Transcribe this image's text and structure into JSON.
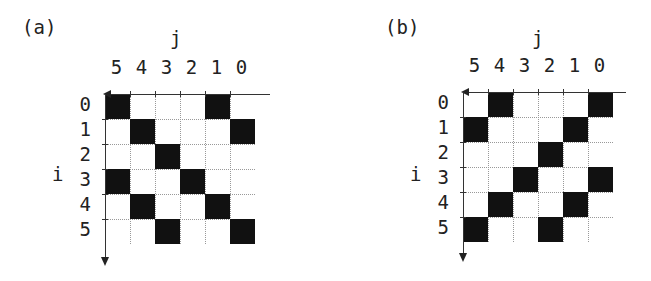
{
  "panels": [
    {
      "id": "a",
      "label": "(a)",
      "col_axis_title": "j",
      "row_axis_title": "i",
      "col_labels": [
        "5",
        "4",
        "3",
        "2",
        "1",
        "0"
      ],
      "row_labels": [
        "0",
        "1",
        "2",
        "3",
        "4",
        "5"
      ],
      "filled": [
        [
          1,
          0,
          0,
          0,
          1,
          0
        ],
        [
          0,
          1,
          0,
          0,
          0,
          1
        ],
        [
          0,
          0,
          1,
          0,
          0,
          0
        ],
        [
          1,
          0,
          0,
          1,
          0,
          0
        ],
        [
          0,
          1,
          0,
          0,
          1,
          0
        ],
        [
          0,
          0,
          1,
          0,
          0,
          1
        ]
      ],
      "origin": {
        "x": 105,
        "y": 94
      }
    },
    {
      "id": "b",
      "label": "(b)",
      "col_axis_title": "j",
      "row_axis_title": "i",
      "col_labels": [
        "5",
        "4",
        "3",
        "2",
        "1",
        "0"
      ],
      "row_labels": [
        "0",
        "1",
        "2",
        "3",
        "4",
        "5"
      ],
      "filled": [
        [
          0,
          1,
          0,
          0,
          0,
          1
        ],
        [
          1,
          0,
          0,
          0,
          1,
          0
        ],
        [
          0,
          0,
          0,
          1,
          0,
          0
        ],
        [
          0,
          0,
          1,
          0,
          0,
          1
        ],
        [
          0,
          1,
          0,
          0,
          1,
          0
        ],
        [
          1,
          0,
          0,
          1,
          0,
          0
        ]
      ],
      "origin": {
        "x": 463,
        "y": 92
      }
    }
  ],
  "colors": {
    "fill": "#111111",
    "grid": "#999999",
    "axis": "#333333"
  }
}
